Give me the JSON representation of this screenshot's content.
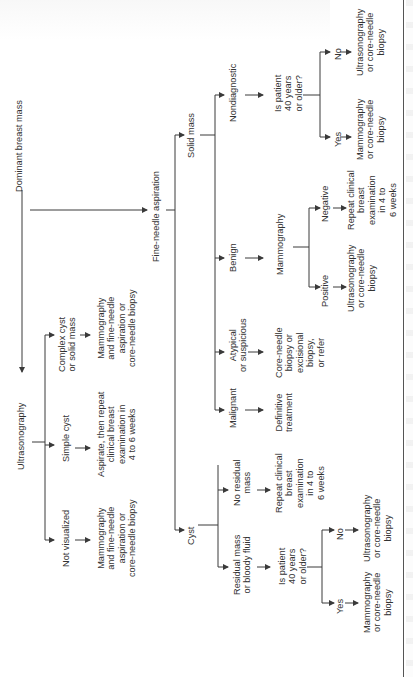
{
  "diagram": {
    "type": "flowchart",
    "orientation": "rotated-90-ccw",
    "root": "Dominant breast mass",
    "nodes": {
      "root": "Dominant breast mass",
      "ultrasonography": "Ultrasonography",
      "us_not_visualized": "Not visualized",
      "us_not_visualized_action": "Mammography\nand fine-needle\naspiration or\ncore-needle biopsy",
      "us_simple_cyst": "Simple cyst",
      "us_simple_cyst_action": "Aspirate, then repeat\nclinical breast\nexamination in\n4 to 6 weeks",
      "us_complex": "Complex cyst\nor solid mass",
      "us_complex_action": "Mammography\nand fine-needle\naspiration or\ncore-needle biopsy",
      "fna": "Fine-needle aspiration",
      "cyst": "Cyst",
      "cyst_residual": "Residual mass\nor bloody fluid",
      "cyst_residual_q": "Is patient\n40 years\nor older?",
      "cyst_yes": "Yes",
      "cyst_yes_action": "Mammography\nor core-needle\nbiopsy",
      "cyst_no": "No",
      "cyst_no_action": "Ultrasonography\nor core-needle\nbiopsy",
      "cyst_no_residual": "No residual\nmass",
      "cyst_no_residual_action": "Repeat clinical\nbreast\nexamination\nin 4 to\n6 weeks",
      "solid": "Solid mass",
      "malignant": "Malignant",
      "malignant_action": "Definitive\ntreatment",
      "atypical": "Atypical\nor suspicious",
      "atypical_action": "Core-needle\nbiopsy or\nexcisional\nbiopsy,\nor refer",
      "benign": "Benign",
      "benign_mammo": "Mammography",
      "benign_positive": "Positive",
      "benign_positive_action": "Ultrasonography\nor core-needle\nbiopsy",
      "benign_negative": "Negative",
      "benign_negative_action": "Repeat clinical\nbreast\nexamination\nin 4 to\n6 weeks",
      "nondiagnostic": "Nondiagnostic",
      "nondiag_q": "Is patient\n40 years\nor older?",
      "nondiag_yes": "Yes",
      "nondiag_yes_action": "Mammography\nor core-needle\nbiopsy",
      "nondiag_no": "No",
      "nondiag_no_action": "Ultrasonography\nor core-needle\nbiopsy"
    },
    "edges": [
      [
        "root",
        "ultrasonography"
      ],
      [
        "root",
        "fna"
      ],
      [
        "ultrasonography",
        "us_not_visualized"
      ],
      [
        "ultrasonography",
        "us_simple_cyst"
      ],
      [
        "ultrasonography",
        "us_complex"
      ],
      [
        "us_not_visualized",
        "us_not_visualized_action"
      ],
      [
        "us_simple_cyst",
        "us_simple_cyst_action"
      ],
      [
        "us_complex",
        "us_complex_action"
      ],
      [
        "fna",
        "cyst"
      ],
      [
        "fna",
        "solid"
      ],
      [
        "cyst",
        "cyst_residual"
      ],
      [
        "cyst",
        "cyst_no_residual"
      ],
      [
        "cyst_residual",
        "cyst_residual_q"
      ],
      [
        "cyst_residual_q",
        "cyst_yes"
      ],
      [
        "cyst_residual_q",
        "cyst_no"
      ],
      [
        "cyst_yes",
        "cyst_yes_action"
      ],
      [
        "cyst_no",
        "cyst_no_action"
      ],
      [
        "cyst_no_residual",
        "cyst_no_residual_action"
      ],
      [
        "solid",
        "malignant"
      ],
      [
        "solid",
        "atypical"
      ],
      [
        "solid",
        "benign"
      ],
      [
        "solid",
        "nondiagnostic"
      ],
      [
        "malignant",
        "malignant_action"
      ],
      [
        "atypical",
        "atypical_action"
      ],
      [
        "benign",
        "benign_mammo"
      ],
      [
        "benign_mammo",
        "benign_positive"
      ],
      [
        "benign_mammo",
        "benign_negative"
      ],
      [
        "benign_positive",
        "benign_positive_action"
      ],
      [
        "benign_negative",
        "benign_negative_action"
      ],
      [
        "nondiagnostic",
        "nondiag_q"
      ],
      [
        "nondiag_q",
        "nondiag_yes"
      ],
      [
        "nondiag_q",
        "nondiag_no"
      ],
      [
        "nondiag_yes",
        "nondiag_yes_action"
      ],
      [
        "nondiag_no",
        "nondiag_no_action"
      ]
    ]
  },
  "colors": {
    "line": "#3a3a3a",
    "text": "#333333",
    "background": "#ffffff"
  }
}
